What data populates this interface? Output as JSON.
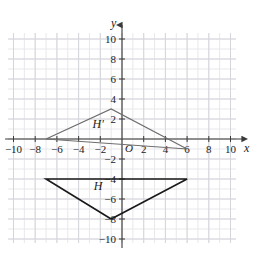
{
  "chart_data": {
    "type": "scatter",
    "title": "",
    "xlabel": "x",
    "ylabel": "y",
    "xlim": [
      -11,
      11
    ],
    "ylim": [
      -11,
      11
    ],
    "grid": true,
    "grid_minor_step": 1,
    "grid_major_step": 2,
    "legend": "none",
    "x_ticks": [
      -10,
      -8,
      -6,
      -4,
      -2,
      2,
      4,
      6,
      8,
      10
    ],
    "y_ticks": [
      10,
      8,
      6,
      4,
      2,
      -2,
      -4,
      -6,
      -8,
      -10
    ],
    "x_tick_labels": [
      "−10",
      "−8",
      "−6",
      "−4",
      "−2",
      "2",
      "4",
      "6",
      "8",
      "10"
    ],
    "y_tick_labels": [
      "10",
      "8",
      "6",
      "4",
      "2",
      "−2",
      "−4",
      "−6",
      "−8",
      "−10"
    ],
    "origin_label": "O",
    "series": [
      {
        "name": "H'",
        "label": "H′",
        "type": "polygon",
        "color": "#6e6e6e",
        "points": [
          [
            -7,
            0
          ],
          [
            -1,
            3
          ],
          [
            6,
            -1
          ]
        ],
        "label_position": [
          -2.2,
          1.1
        ]
      },
      {
        "name": "H",
        "label": "H",
        "type": "polygon",
        "color": "#1a1a1a",
        "points": [
          [
            -7,
            -4
          ],
          [
            6,
            -4
          ],
          [
            -1,
            -8
          ]
        ],
        "label_position": [
          -2.2,
          -5.1
        ]
      }
    ],
    "annotations": [
      {
        "text": "H′",
        "x": -2.2,
        "y": 1.1
      },
      {
        "text": "H",
        "x": -2.2,
        "y": -5.1
      }
    ]
  },
  "axes": {
    "x_axis_label": "x",
    "y_axis_label": "y",
    "origin": "O"
  },
  "colors": {
    "grid_minor": "#e8e8ec",
    "grid_major": "#d5d5dc",
    "axis": "#3a3a3a",
    "shape_h": "#1a1a1a",
    "shape_h_prime": "#6e6e6e",
    "text": "#1a1a1a",
    "background": "#ffffff"
  }
}
